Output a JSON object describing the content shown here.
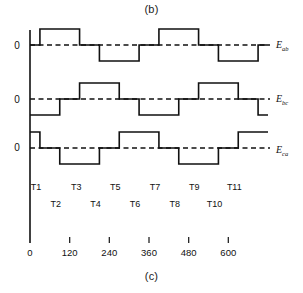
{
  "figure": {
    "caption_top": "(b)",
    "caption_bottom": "(c)"
  },
  "axes": {
    "zero_label": "0",
    "origin_label": "0",
    "x_ticks": [
      "120",
      "240",
      "360",
      "480",
      "600"
    ],
    "x_tick_values": [
      120,
      240,
      360,
      480,
      600
    ],
    "x_range": [
      0,
      720
    ],
    "x_origin_value": 0
  },
  "signals": [
    {
      "name": "E_ab",
      "base": "E",
      "sub": "ab"
    },
    {
      "name": "E_bc",
      "base": "E",
      "sub": "bc"
    },
    {
      "name": "E_ca",
      "base": "E",
      "sub": "ca"
    }
  ],
  "interval_labels_upper": [
    "T1",
    "T3",
    "T5",
    "T7",
    "T9",
    "T11"
  ],
  "interval_labels_lower": [
    "T2",
    "T4",
    "T6",
    "T8",
    "T10"
  ],
  "chart_data": {
    "type": "line",
    "xlabel": "",
    "ylabel": "",
    "xlim": [
      0,
      720
    ],
    "ylim": [
      -1.35,
      1.35
    ],
    "grid": false,
    "legend_position": "right",
    "x_tick_labels": [
      "0",
      "120",
      "240",
      "360",
      "480",
      "600"
    ],
    "x_tick_positions": [
      0,
      120,
      240,
      360,
      480,
      600
    ],
    "note": "Six-step 120-degree conduction line voltages; each waveform is a quasi-square wave with 120 deg on / 60 deg zero segments, mutually phase shifted by 120 deg.",
    "series": [
      {
        "name": "E_ab",
        "steps": [
          {
            "from": 0,
            "to": 30,
            "value": 0
          },
          {
            "from": 30,
            "to": 150,
            "value": 1
          },
          {
            "from": 150,
            "to": 210,
            "value": 0
          },
          {
            "from": 210,
            "to": 330,
            "value": -1
          },
          {
            "from": 330,
            "to": 390,
            "value": 0
          },
          {
            "from": 390,
            "to": 510,
            "value": 1
          },
          {
            "from": 510,
            "to": 570,
            "value": 0
          },
          {
            "from": 570,
            "to": 690,
            "value": -1
          },
          {
            "from": 690,
            "to": 720,
            "value": 0
          }
        ]
      },
      {
        "name": "E_bc",
        "steps": [
          {
            "from": 0,
            "to": 90,
            "value": -1
          },
          {
            "from": 90,
            "to": 150,
            "value": 0
          },
          {
            "from": 150,
            "to": 270,
            "value": 1
          },
          {
            "from": 270,
            "to": 330,
            "value": 0
          },
          {
            "from": 330,
            "to": 450,
            "value": -1
          },
          {
            "from": 450,
            "to": 510,
            "value": 0
          },
          {
            "from": 510,
            "to": 630,
            "value": 1
          },
          {
            "from": 630,
            "to": 690,
            "value": 0
          },
          {
            "from": 690,
            "to": 720,
            "value": -1
          }
        ]
      },
      {
        "name": "E_ca",
        "steps": [
          {
            "from": 0,
            "to": 30,
            "value": 1
          },
          {
            "from": 30,
            "to": 90,
            "value": 0
          },
          {
            "from": 90,
            "to": 210,
            "value": -1
          },
          {
            "from": 210,
            "to": 270,
            "value": 0
          },
          {
            "from": 270,
            "to": 390,
            "value": 1
          },
          {
            "from": 390,
            "to": 450,
            "value": 0
          },
          {
            "from": 450,
            "to": 570,
            "value": -1
          },
          {
            "from": 570,
            "to": 630,
            "value": 0
          },
          {
            "from": 630,
            "to": 720,
            "value": 1
          }
        ]
      }
    ],
    "interval_markers": {
      "upper": [
        {
          "label": "T1",
          "x": 18
        },
        {
          "label": "T3",
          "x": 140
        },
        {
          "label": "T5",
          "x": 258
        },
        {
          "label": "T7",
          "x": 378
        },
        {
          "label": "T9",
          "x": 497
        },
        {
          "label": "T11",
          "x": 618
        }
      ],
      "lower": [
        {
          "label": "T2",
          "x": 78
        },
        {
          "label": "T4",
          "x": 198
        },
        {
          "label": "T6",
          "x": 318
        },
        {
          "label": "T8",
          "x": 438
        },
        {
          "label": "T10",
          "x": 558
        }
      ]
    }
  },
  "colors": {
    "stroke": "#111111",
    "background": "#ffffff"
  }
}
